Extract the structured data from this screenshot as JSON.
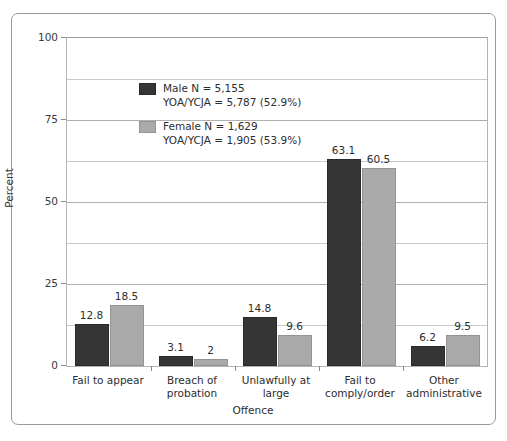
{
  "chart_data": {
    "type": "bar",
    "title": "",
    "xlabel": "Offence",
    "ylabel": "Percent",
    "ylim": [
      0,
      100
    ],
    "yticks": [
      0,
      25,
      50,
      75,
      100
    ],
    "ytick_labels": [
      "0",
      "25",
      "50",
      "75",
      "100"
    ],
    "minor_gridlines": [
      12.5,
      37.5,
      62.5,
      87.5
    ],
    "grid": true,
    "legend_position": "upper-left-inside",
    "categories": [
      "Fail to appear",
      "Breach of\nprobation",
      "Unlawfully at\nlarge",
      "Fail to\ncomply/order",
      "Other\nadministrative"
    ],
    "series": [
      {
        "name": "Male",
        "color": "#353535",
        "values": [
          12.8,
          3.1,
          14.8,
          63.1,
          6.2
        ],
        "labels": [
          "12.8",
          "3.1",
          "14.8",
          "63.1",
          "6.2"
        ],
        "legend_line1": "Male N = 5,155",
        "legend_line2": "YOA/YCJA = 5,787 (52.9%)"
      },
      {
        "name": "Female",
        "color": "#aaaaaa",
        "values": [
          18.5,
          2,
          9.6,
          60.5,
          9.5
        ],
        "labels": [
          "18.5",
          "2",
          "9.6",
          "60.5",
          "9.5"
        ],
        "legend_line1": "Female N = 1,629",
        "legend_line2": "YOA/YCJA = 1,905 (53.9%)"
      }
    ]
  }
}
